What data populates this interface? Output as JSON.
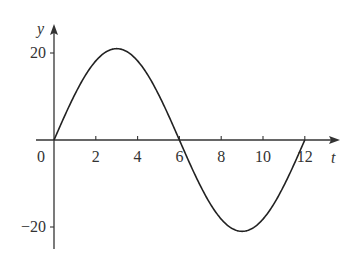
{
  "chart_data": {
    "type": "line",
    "title": "",
    "xlabel": "t",
    "ylabel": "y",
    "x_ticks": [
      0,
      2,
      4,
      6,
      8,
      10,
      12
    ],
    "x_tick_labels": [
      "0",
      "2",
      "4",
      "6",
      "8",
      "10",
      "12"
    ],
    "y_ticks": [
      20,
      -20
    ],
    "y_tick_labels": [
      "20",
      "−20"
    ],
    "xlim": [
      0,
      12.8
    ],
    "ylim": [
      -25,
      27
    ],
    "grid": false,
    "legend": null,
    "function": "y = 21 sin(pi t / 6)",
    "series": [
      {
        "name": "y",
        "x": [
          0,
          1,
          2,
          3,
          4,
          5,
          6,
          7,
          8,
          9,
          10,
          11,
          12
        ],
        "values": [
          0,
          10.5,
          18.2,
          21,
          18.2,
          10.5,
          0,
          -10.5,
          -18.2,
          -21,
          -18.2,
          -10.5,
          0
        ]
      }
    ]
  }
}
